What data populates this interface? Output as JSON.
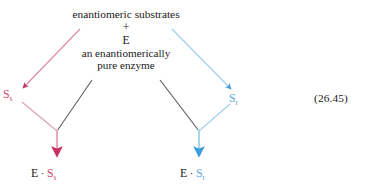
{
  "figure": {
    "equation_number": "(26.45)",
    "reactant_block": {
      "line1": "enantiomeric substrates",
      "line2": "+",
      "line3": "E",
      "line4": "an enantiomerically",
      "line5": "pure enzyme"
    },
    "species": {
      "left": {
        "symbol": "S",
        "subscript": "s",
        "color": "#d0436c"
      },
      "right": {
        "symbol": "S",
        "subscript": "r",
        "color": "#5aa8dd"
      }
    },
    "products": {
      "left": {
        "enzyme": "E",
        "operator": "·",
        "symbol": "S",
        "subscript": "s",
        "color": "#d0436c"
      },
      "right": {
        "enzyme": "E",
        "operator": "·",
        "symbol": "S",
        "subscript": "r",
        "color": "#5aa8dd"
      }
    },
    "colors": {
      "crimson": "#d0436c",
      "pink_shaft": "#e5a0b8",
      "blue": "#3f9ede",
      "light_blue": "#9fcfee",
      "dark_line": "#55555a",
      "text": "#1a1a1a"
    }
  }
}
